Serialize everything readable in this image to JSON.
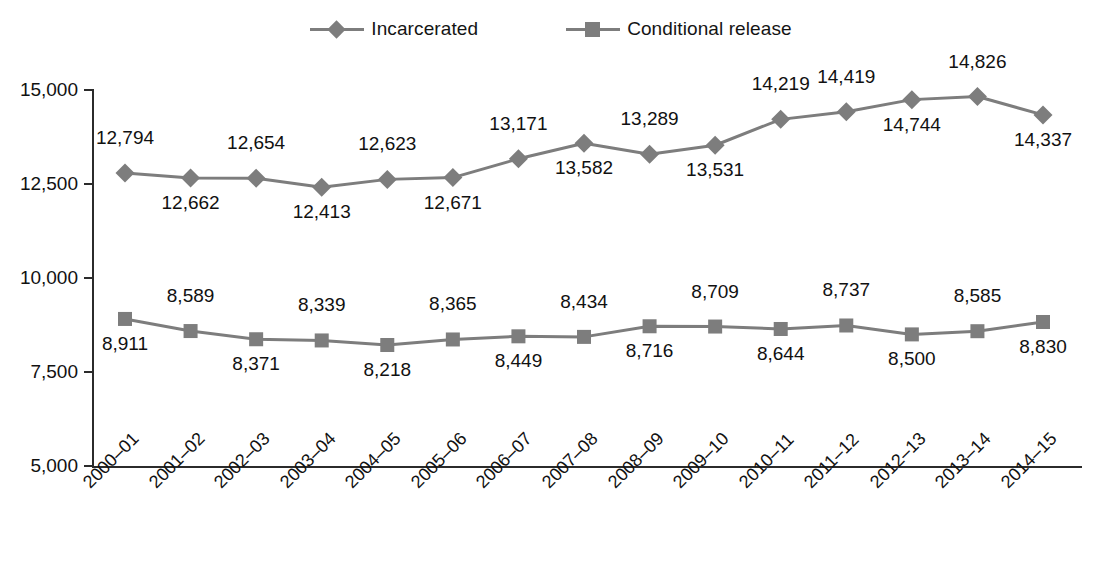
{
  "chart_data": {
    "type": "line",
    "title": "",
    "subtitle": "",
    "xlabel": "",
    "ylabel": "",
    "ylim": [
      5000,
      15000
    ],
    "ytick_values": [
      15000,
      12500,
      10000,
      7500,
      5000
    ],
    "ytick_labels": [
      "15,000",
      "12,500",
      "10,000",
      "7,500",
      "5,000"
    ],
    "grid": false,
    "legend_position": "top-center",
    "categories": [
      "2000–01",
      "2001–02",
      "2002–03",
      "2003–04",
      "2004–05",
      "2005–06",
      "2006–07",
      "2007–08",
      "2008–09",
      "2009–10",
      "2010–11",
      "2011–12",
      "2012–13",
      "2013–14",
      "2014–15"
    ],
    "series": [
      {
        "name": "Incarcerated",
        "marker": "diamond",
        "color": "#7d7d7d",
        "values": [
          12794,
          12662,
          12654,
          12413,
          12623,
          12671,
          13171,
          13582,
          13289,
          13531,
          14219,
          14419,
          14744,
          14826,
          14337
        ],
        "labels": [
          "12,794",
          "12,662",
          "12,654",
          "12,413",
          "12,623",
          "12,671",
          "13,171",
          "13,582",
          "13,289",
          "13,531",
          "14,219",
          "14,419",
          "14,744",
          "14,826",
          "14,337"
        ],
        "label_positions": [
          "above",
          "below",
          "above",
          "below",
          "above",
          "below",
          "above",
          "below",
          "above",
          "below",
          "above",
          "above",
          "below",
          "above",
          "below"
        ]
      },
      {
        "name": "Conditional release",
        "marker": "square",
        "color": "#7d7d7d",
        "values": [
          8911,
          8589,
          8371,
          8339,
          8218,
          8365,
          8449,
          8434,
          8716,
          8709,
          8644,
          8737,
          8500,
          8585,
          8830
        ],
        "labels": [
          "8,911",
          "8,589",
          "8,371",
          "8,339",
          "8,218",
          "8,365",
          "8,449",
          "8,434",
          "8,716",
          "8,709",
          "8,644",
          "8,737",
          "8,500",
          "8,585",
          "8,830"
        ],
        "label_positions": [
          "below",
          "above",
          "below",
          "above",
          "below",
          "above",
          "below",
          "above",
          "below",
          "above",
          "below",
          "above",
          "below",
          "above",
          "below"
        ]
      }
    ]
  },
  "legend": {
    "entries": [
      {
        "label": "Incarcerated",
        "marker": "diamond"
      },
      {
        "label": "Conditional release",
        "marker": "square"
      }
    ]
  },
  "colors": {
    "series": "#7d7d7d",
    "axis": "#2b2b2b",
    "text": "#111111",
    "background": "#ffffff"
  }
}
